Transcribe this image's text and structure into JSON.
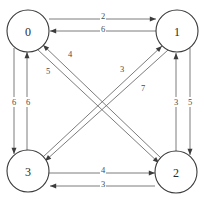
{
  "figure": {
    "type": "directed-weighted-graph",
    "width": 204,
    "height": 204,
    "background_color": "#ffffff",
    "node_stroke_color": "#3a3a3a",
    "edge_stroke_color": "#6d6d6d",
    "arrow_color": "#3c3c3c",
    "label_color": "#2a2a2a"
  },
  "nodes": [
    {
      "id": "0",
      "label": "0",
      "cx": 28,
      "cy": 31,
      "r": 21
    },
    {
      "id": "1",
      "label": "1",
      "cx": 177,
      "cy": 31,
      "r": 21
    },
    {
      "id": "2",
      "label": "2",
      "cx": 176,
      "cy": 172,
      "r": 21
    },
    {
      "id": "3",
      "label": "3",
      "cx": 28,
      "cy": 171,
      "r": 21
    }
  ],
  "edges": [
    {
      "id": "e-0-1",
      "from": "0",
      "to": "1",
      "weight": "2",
      "x1": 49,
      "y1": 19,
      "x2": 156,
      "y2": 19,
      "lx": 103,
      "ly": 16
    },
    {
      "id": "e-1-0",
      "from": "1",
      "to": "0",
      "weight": "6",
      "x1": 156,
      "y1": 31,
      "x2": 50,
      "y2": 31,
      "lx": 103,
      "ly": 29
    },
    {
      "id": "e-0-3",
      "from": "0",
      "to": "3",
      "weight": "6",
      "x1": 14,
      "y1": 48,
      "x2": 14,
      "y2": 154,
      "lx": 14,
      "ly": 102
    },
    {
      "id": "e-3-0",
      "from": "3",
      "to": "0",
      "weight": "6",
      "x1": 27,
      "y1": 150,
      "x2": 27,
      "y2": 52,
      "lx": 28,
      "ly": 102
    },
    {
      "id": "e-2-1",
      "from": "2",
      "to": "1",
      "weight": "3",
      "x1": 176,
      "y1": 151,
      "x2": 176,
      "y2": 53,
      "lx": 176,
      "ly": 102
    },
    {
      "id": "e-1-2",
      "from": "1",
      "to": "2",
      "weight": "5",
      "x1": 190,
      "y1": 48,
      "x2": 190,
      "y2": 155,
      "lx": 190,
      "ly": 102
    },
    {
      "id": "e-3-2",
      "from": "3",
      "to": "2",
      "weight": "4",
      "x1": 49,
      "y1": 173,
      "x2": 155,
      "y2": 173,
      "lx": 103,
      "ly": 170
    },
    {
      "id": "e-2-3",
      "from": "2",
      "to": "3",
      "weight": "3",
      "x1": 155,
      "y1": 186,
      "x2": 50,
      "y2": 186,
      "lx": 103,
      "ly": 184
    },
    {
      "id": "e-2-0",
      "from": "2",
      "to": "0",
      "weight": "4",
      "x1": 161,
      "y1": 158,
      "x2": 43,
      "y2": 45,
      "lx": 70,
      "ly": 54
    },
    {
      "id": "e-0-2",
      "from": "0",
      "to": "2",
      "weight": "5",
      "x1": 37,
      "y1": 49,
      "x2": 159,
      "y2": 163,
      "lx": 48,
      "ly": 71
    },
    {
      "id": "e-3-1",
      "from": "3",
      "to": "1",
      "weight": "3",
      "x1": 43,
      "y1": 157,
      "x2": 162,
      "y2": 46,
      "lx": 122,
      "ly": 69
    },
    {
      "id": "e-1-3",
      "from": "1",
      "to": "3",
      "weight": "7",
      "x1": 168,
      "y1": 50,
      "x2": 45,
      "y2": 161,
      "lx": 143,
      "ly": 88
    }
  ]
}
